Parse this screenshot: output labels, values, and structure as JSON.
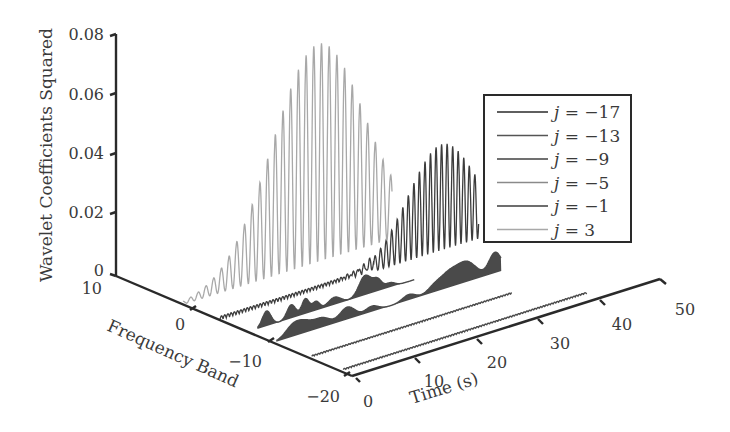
{
  "chart_data": {
    "type": "line",
    "subtype": "3d-waterfall",
    "title": "",
    "zlabel": "Wavelet Coefficients Squared",
    "ylabel": "Frequency Band",
    "xlabel": "Time (s)",
    "zlim": [
      0,
      0.08
    ],
    "ylim": [
      -20,
      10
    ],
    "xlim": [
      0,
      50
    ],
    "z_ticks": [
      "0",
      "0.02",
      "0.04",
      "0.06",
      "0.08"
    ],
    "y_ticks": [
      "10",
      "0",
      "−10",
      "−20"
    ],
    "x_ticks": [
      "0",
      "10",
      "20",
      "30",
      "40",
      "50"
    ],
    "grid": false,
    "legend_position": "upper right",
    "series": [
      {
        "name": "j = −17",
        "j": -17,
        "color": "#2a2a2a",
        "peak": 0.0005,
        "shape": "flat",
        "x_end": 40
      },
      {
        "name": "j = −13",
        "j": -13,
        "color": "#555555",
        "peak": 0.002,
        "shape": "flat",
        "x_end": 33
      },
      {
        "name": "j = −9",
        "j": -9,
        "color": "#404040",
        "peak": 0.006,
        "shape": "bursts",
        "x_end": 33
      },
      {
        "name": "j = −5",
        "j": -5,
        "color": "#8a8a8a",
        "peak": 0.005,
        "shape": "bursts",
        "x_end": 28
      },
      {
        "name": "j = −1",
        "j": -1,
        "color": "#3c3c3c",
        "peak": 0.035,
        "shape": "oscillating-envelope",
        "peak_time": 36
      },
      {
        "name": "j = 3",
        "j": 3,
        "color": "#a8a8a8",
        "peak": 0.072,
        "shape": "oscillating-envelope",
        "peak_time": 22
      }
    ]
  },
  "axes": {
    "z_label": "Wavelet Coefficients Squared",
    "y_label": "Frequency Band",
    "x_label": "Time (s)",
    "z_ticks": [
      "0",
      "0.02",
      "0.04",
      "0.06",
      "0.08"
    ],
    "y_ticks": [
      "10",
      "0",
      "−10",
      "−20"
    ],
    "x_ticks": [
      "0",
      "10",
      "20",
      "30",
      "40",
      "50"
    ]
  },
  "legend": {
    "items": [
      {
        "prefix": "j",
        "rest": " = −17",
        "color": "#2a2a2a"
      },
      {
        "prefix": "j",
        "rest": " = −13",
        "color": "#555555"
      },
      {
        "prefix": "j",
        "rest": " = −9",
        "color": "#404040"
      },
      {
        "prefix": "j",
        "rest": " = −5",
        "color": "#8a8a8a"
      },
      {
        "prefix": "j",
        "rest": " = −1",
        "color": "#3c3c3c"
      },
      {
        "prefix": "j",
        "rest": " = 3",
        "color": "#a8a8a8"
      }
    ]
  }
}
